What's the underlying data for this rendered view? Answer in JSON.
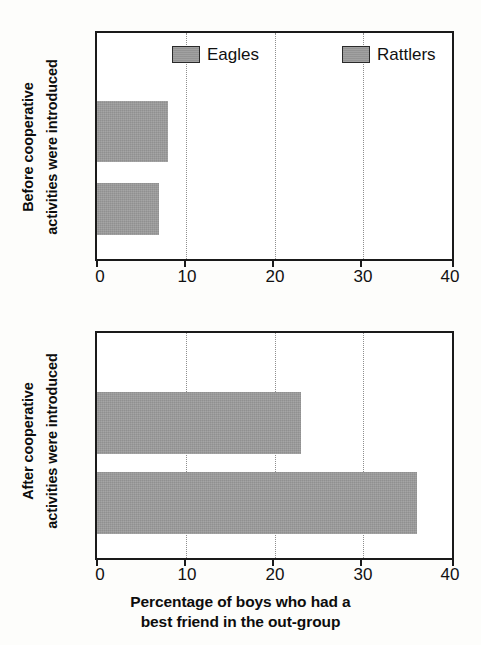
{
  "figure": {
    "background_color": "#fdfdfb",
    "bar_color": "#9b9b9b",
    "axis_color": "#1a1a1a",
    "gridline_color": "#8e8e8e"
  },
  "legend": {
    "items": [
      {
        "label": "Eagles",
        "color": "#9b9b9b"
      },
      {
        "label": "Rattlers",
        "color": "#9b9b9b"
      }
    ]
  },
  "panels": [
    {
      "id": "before",
      "ylabel_line1": "Before cooperative",
      "ylabel_line2": "activities were introduced",
      "bars": [
        {
          "series": "Eagles",
          "value": 8
        },
        {
          "series": "Rattlers",
          "value": 7
        }
      ]
    },
    {
      "id": "after",
      "ylabel_line1": "After cooperative",
      "ylabel_line2": "activities were introduced",
      "bars": [
        {
          "series": "Eagles",
          "value": 23
        },
        {
          "series": "Rattlers",
          "value": 36
        }
      ]
    }
  ],
  "axis": {
    "ticks": [
      "0",
      "10",
      "20",
      "30",
      "40"
    ],
    "title_line1": "Percentage of boys who had a",
    "title_line2": "best friend in the out-group"
  },
  "chart_data": {
    "type": "bar",
    "orientation": "horizontal",
    "title": "",
    "xlabel": "Percentage of boys who had a best friend in the out-group",
    "ylabel": "",
    "xlim": [
      0,
      40
    ],
    "xticks": [
      0,
      10,
      20,
      30,
      40
    ],
    "grid": "dotted vertical gridlines at 10, 20, 30",
    "legend": [
      "Eagles",
      "Rattlers"
    ],
    "legend_position": "top inside first panel",
    "panels": [
      {
        "label": "Before cooperative activities were introduced",
        "categories": [
          "Eagles",
          "Rattlers"
        ],
        "values": [
          8,
          7
        ]
      },
      {
        "label": "After cooperative activities were introduced",
        "categories": [
          "Eagles",
          "Rattlers"
        ],
        "values": [
          23,
          36
        ]
      }
    ],
    "series": [
      {
        "name": "Eagles",
        "values": [
          8,
          23
        ]
      },
      {
        "name": "Rattlers",
        "values": [
          7,
          36
        ]
      }
    ],
    "x": [
      "Before cooperative activities were introduced",
      "After cooperative activities were introduced"
    ]
  }
}
